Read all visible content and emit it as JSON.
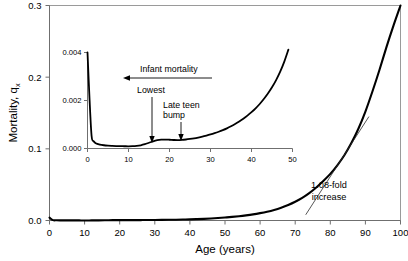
{
  "chart_data": {
    "type": "line",
    "title": "",
    "xlabel": "Age (years)",
    "ylabel": "Mortality, q",
    "ylabel_subscript": "x",
    "xlim": [
      0,
      100
    ],
    "ylim": [
      0.0,
      0.3
    ],
    "grid": false,
    "legend": "none",
    "xticks": [
      0,
      10,
      20,
      30,
      40,
      50,
      60,
      70,
      80,
      90,
      100
    ],
    "xticklabels": [
      "0",
      "10",
      "20",
      "30",
      "40",
      "50",
      "60",
      "70",
      "80",
      "90",
      "100"
    ],
    "yticks": [
      0.0,
      0.1,
      0.2,
      0.3
    ],
    "yticklabels": [
      "0.0",
      "0.1",
      "0.2",
      "0.3"
    ],
    "series": [
      {
        "name": "Mortality rate qx",
        "x": [
          0,
          1,
          2,
          3,
          4,
          5,
          6,
          7,
          8,
          9,
          10,
          12,
          14,
          16,
          18,
          20,
          22,
          24,
          26,
          28,
          30,
          32,
          34,
          36,
          38,
          40,
          42,
          44,
          46,
          48,
          50,
          52,
          54,
          56,
          58,
          60,
          62,
          64,
          66,
          68,
          70,
          72,
          74,
          76,
          78,
          80,
          82,
          84,
          86,
          88,
          90,
          92,
          94,
          96,
          98,
          100
        ],
        "y": [
          0.004,
          0.0005,
          0.0003,
          0.00022,
          0.00018,
          0.00015,
          0.00013,
          0.00012,
          0.00011,
          0.0001,
          0.0001,
          0.00011,
          0.00016,
          0.0003,
          0.00048,
          0.00052,
          0.00052,
          0.00054,
          0.00058,
          0.00064,
          0.00072,
          0.00082,
          0.00095,
          0.00112,
          0.00133,
          0.00158,
          0.0019,
          0.0023,
          0.0028,
          0.0034,
          0.00415,
          0.005,
          0.006,
          0.0072,
          0.0086,
          0.0103,
          0.0123,
          0.0148,
          0.0179,
          0.0216,
          0.0261,
          0.0315,
          0.0381,
          0.046,
          0.055,
          0.065,
          0.077,
          0.091,
          0.108,
          0.128,
          0.152,
          0.18,
          0.21,
          0.242,
          0.272,
          0.3
        ]
      }
    ],
    "annotations": [
      {
        "name": "tangent-line",
        "label": "1.08-fold increase",
        "label_lines": [
          "1.08-fold",
          "increase"
        ],
        "x_from": 73,
        "x_to": 91,
        "y_from": 0.008,
        "y_to": 0.145
      }
    ],
    "inset": {
      "xlim": [
        0,
        50
      ],
      "ylim": [
        0.0,
        0.004
      ],
      "xticks": [
        0,
        10,
        20,
        30,
        40,
        50
      ],
      "xticklabels": [
        "0",
        "10",
        "20",
        "30",
        "40",
        "50"
      ],
      "yticks": [
        0.0,
        0.002,
        0.004
      ],
      "yticklabels": [
        "0.000",
        "0.002",
        "0.004"
      ],
      "series": [
        {
          "name": "Mortality rate qx (detail)",
          "x": [
            0,
            0.5,
            1,
            1.5,
            2,
            3,
            4,
            5,
            6,
            7,
            8,
            9,
            10,
            11,
            12,
            13,
            14,
            15,
            16,
            17,
            18,
            19,
            20,
            21,
            22,
            23,
            24,
            25,
            26,
            27,
            28,
            29,
            30,
            31,
            32,
            33,
            34,
            35,
            36,
            37,
            38,
            39,
            40,
            41,
            42,
            43,
            44,
            45,
            46,
            47,
            48,
            49
          ],
          "y": [
            0.004,
            0.00205,
            0.00052,
            0.0003,
            0.00022,
            0.000165,
            0.000135,
            0.000118,
            0.000108,
            0.000101,
            9.65e-05,
            9.35e-05,
            9.2e-05,
            9.5e-05,
            0.000108,
            0.000135,
            0.00018,
            0.00024,
            0.0003,
            0.000345,
            0.000368,
            0.000372,
            0.000365,
            0.000355,
            0.00035,
            0.000358,
            0.000375,
            0.000398,
            0.000425,
            0.000458,
            0.000495,
            0.000538,
            0.000585,
            0.000638,
            0.000698,
            0.000765,
            0.00084,
            0.000925,
            0.00102,
            0.001125,
            0.00124,
            0.00137,
            0.001515,
            0.001675,
            0.001855,
            0.00206,
            0.00229,
            0.00255,
            0.00285,
            0.0032,
            0.00362,
            0.00412
          ]
        }
      ],
      "annotations": [
        {
          "name": "infant-mortality",
          "label": "Infant mortality",
          "arrow": "left",
          "target_x": 1
        },
        {
          "name": "lowest",
          "label": "Lowest",
          "arrow": "down",
          "target_x": 10
        },
        {
          "name": "late-teen-bump",
          "label_lines": [
            "Late teen",
            "bump"
          ],
          "label": "Late teen bump",
          "arrow": "down",
          "target_x": 18.5
        }
      ]
    },
    "colors": {
      "curve": "#000000",
      "axis": "#6f6f6f",
      "frame": "#9a9a9a",
      "tangent": "#2b2b2b",
      "background": "#ffffff"
    }
  }
}
